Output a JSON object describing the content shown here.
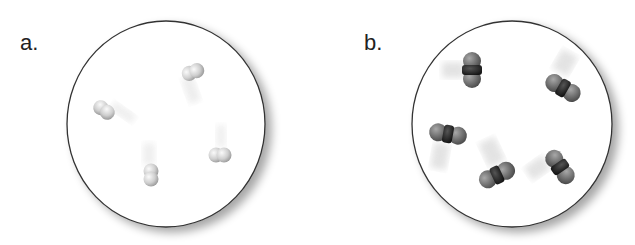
{
  "panels": [
    {
      "label": "a.",
      "description": "Container with diatomic molecules of a light gas (single element, light gray atoms)",
      "molecule_count": 4,
      "atom_color": "#d0d0d0",
      "molecules": [
        {
          "x": 193,
          "y": 72,
          "angle": 20
        },
        {
          "x": 104,
          "y": 110,
          "angle": 35
        },
        {
          "x": 220,
          "y": 155,
          "angle": 0
        },
        {
          "x": 151,
          "y": 175,
          "angle": 90
        }
      ]
    },
    {
      "label": "b.",
      "description": "Container with triatomic molecules (dark central atom, gray outer atoms)",
      "molecule_count": 5,
      "outer_atom_color": "#7a7a7a",
      "center_atom_color": "#2a2a2a",
      "molecules": [
        {
          "x": 472,
          "y": 70,
          "angle": 90
        },
        {
          "x": 563,
          "y": 88,
          "angle": 30
        },
        {
          "x": 448,
          "y": 134,
          "angle": 10
        },
        {
          "x": 497,
          "y": 175,
          "angle": -25
        },
        {
          "x": 560,
          "y": 167,
          "angle": 55
        }
      ]
    }
  ]
}
